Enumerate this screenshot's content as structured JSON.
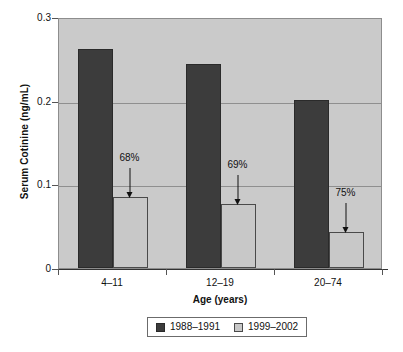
{
  "chart_data": {
    "type": "bar",
    "title": "",
    "subtitle": "",
    "xlabel": "Age (years)",
    "ylabel": "Serum Cotinine (ng/mL)",
    "categories": [
      "4–11",
      "12–19",
      "20–74"
    ],
    "series": [
      {
        "name": "1988–1991",
        "color": "#3c3c3c",
        "values": [
          0.262,
          0.244,
          0.201
        ]
      },
      {
        "name": "1999–2002",
        "color": "#c8c8c8",
        "values": [
          0.085,
          0.076,
          0.043
        ]
      }
    ],
    "ylim": [
      0,
      0.3
    ],
    "yticks": [
      0.3,
      0.2,
      0.1,
      0
    ],
    "ytick_labels": [
      "0.3",
      "0.2",
      "0.1",
      "0"
    ],
    "grid": "horizontal",
    "legend_position": "bottom",
    "annotations": [
      {
        "text": "68%",
        "category": "4–11",
        "points_to_series": "1999–2002"
      },
      {
        "text": "69%",
        "category": "12–19",
        "points_to_series": "1999–2002"
      },
      {
        "text": "75%",
        "category": "20–74",
        "points_to_series": "1999–2002"
      }
    ],
    "plot_background": "#cacaca",
    "page_background": "#ffffff"
  },
  "legend": {
    "items": [
      {
        "label": "1988–1991",
        "swatch": "dark-square-swatch"
      },
      {
        "label": "1999–2002",
        "swatch": "light-square-swatch"
      }
    ]
  }
}
